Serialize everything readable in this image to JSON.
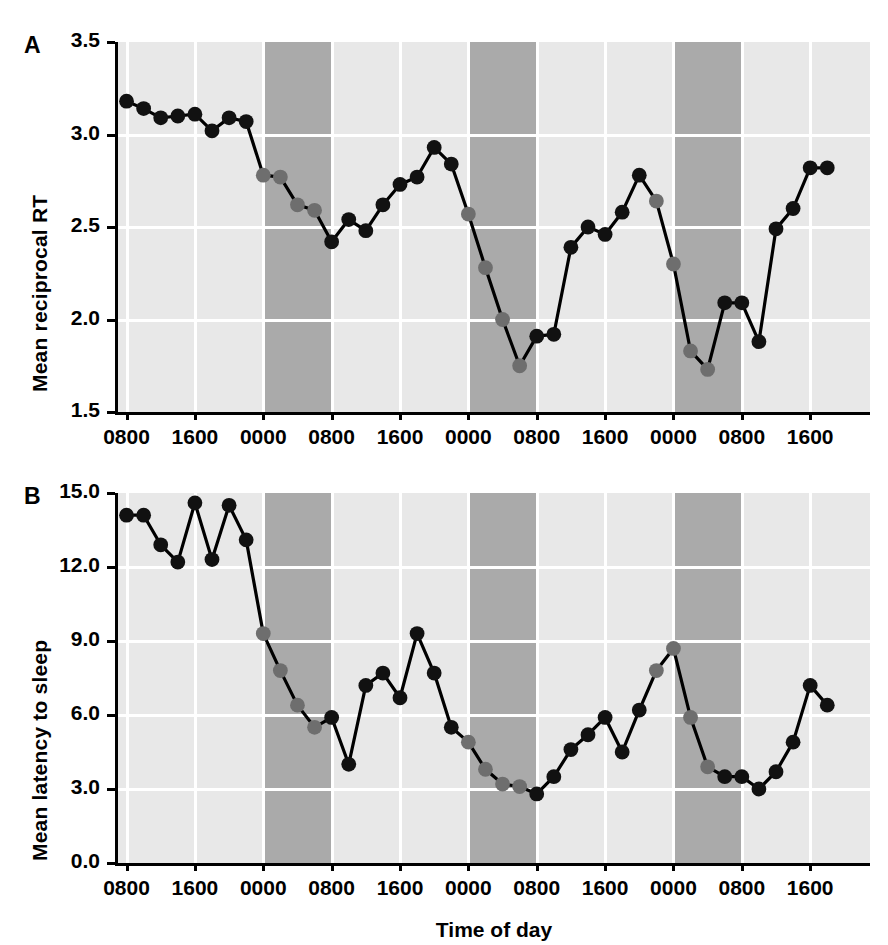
{
  "figure": {
    "xaxis_title": "Time of day",
    "tick_labels_x": [
      "0800",
      "1600",
      "0000",
      "0800",
      "1600",
      "0000",
      "0800",
      "1600",
      "0000",
      "0800",
      "1600"
    ],
    "colors": {
      "daytime_band": "#e8e8e8",
      "night_band": "#aaaaaa",
      "gridline": "#ffffff",
      "line": "#000000",
      "marker_wake": "#111111",
      "marker_sleep": "#6e6e6e"
    }
  },
  "chart_data": [
    {
      "type": "line",
      "panel": "A",
      "panel_letter": "A",
      "title": "",
      "xlabel": "Time of day",
      "ylabel": "Mean reciprocal RT",
      "ylim": [
        1.5,
        3.5
      ],
      "ytick_labels": [
        "3.5",
        "3.0",
        "2.5",
        "2.0",
        "1.5"
      ],
      "yticks": [
        3.5,
        3.0,
        2.5,
        2.0,
        1.5
      ],
      "xlim_hours": [
        7,
        95
      ],
      "xtick_hours": [
        8,
        16,
        24,
        32,
        40,
        48,
        56,
        64,
        72,
        80,
        88
      ],
      "xtick_labels": [
        "0800",
        "1600",
        "0000",
        "0800",
        "1600",
        "0000",
        "0800",
        "1600",
        "0000",
        "0800",
        "1600"
      ],
      "grid": true,
      "legend": "none",
      "night_bands_hours": [
        [
          24,
          32
        ],
        [
          48,
          56
        ],
        [
          72,
          80
        ]
      ],
      "x": [
        8,
        10,
        12,
        14,
        16,
        18,
        20,
        22,
        24,
        26,
        28,
        30,
        32,
        34,
        36,
        38,
        40,
        42,
        44,
        46,
        48,
        50,
        52,
        54,
        56,
        58,
        60,
        62,
        64,
        66,
        68,
        70,
        72,
        74,
        76,
        78,
        80,
        82,
        84,
        86,
        88,
        90
      ],
      "values": [
        3.18,
        3.14,
        3.09,
        3.1,
        3.11,
        3.02,
        3.09,
        3.07,
        2.78,
        2.77,
        2.62,
        2.59,
        2.42,
        2.54,
        2.48,
        2.62,
        2.73,
        2.77,
        2.93,
        2.84,
        2.57,
        2.28,
        2.0,
        1.75,
        1.91,
        1.92,
        2.39,
        2.5,
        2.46,
        2.58,
        2.78,
        2.64,
        2.3,
        1.83,
        1.73,
        2.09,
        2.09,
        1.88,
        2.49,
        2.6,
        2.82,
        2.82
      ],
      "marker_state": [
        "wake",
        "wake",
        "wake",
        "wake",
        "wake",
        "wake",
        "wake",
        "wake",
        "sleep",
        "sleep",
        "sleep",
        "sleep",
        "wake",
        "wake",
        "wake",
        "wake",
        "wake",
        "wake",
        "wake",
        "wake",
        "sleep",
        "sleep",
        "sleep",
        "sleep",
        "wake",
        "wake",
        "wake",
        "wake",
        "wake",
        "wake",
        "wake",
        "sleep",
        "sleep",
        "sleep",
        "sleep",
        "wake",
        "wake",
        "wake",
        "wake",
        "wake",
        "wake",
        "wake"
      ]
    },
    {
      "type": "line",
      "panel": "B",
      "panel_letter": "B",
      "title": "",
      "xlabel": "Time of day",
      "ylabel": "Mean latency to sleep",
      "ylim": [
        0.0,
        15.0
      ],
      "ytick_labels": [
        "15.0",
        "12.0",
        "9.0",
        "6.0",
        "3.0",
        "0.0"
      ],
      "yticks": [
        15.0,
        12.0,
        9.0,
        6.0,
        3.0,
        0.0
      ],
      "xlim_hours": [
        7,
        95
      ],
      "xtick_hours": [
        8,
        16,
        24,
        32,
        40,
        48,
        56,
        64,
        72,
        80,
        88
      ],
      "xtick_labels": [
        "0800",
        "1600",
        "0000",
        "0800",
        "1600",
        "0000",
        "0800",
        "1600",
        "0000",
        "0800",
        "1600"
      ],
      "grid": true,
      "legend": "none",
      "night_bands_hours": [
        [
          24,
          32
        ],
        [
          48,
          56
        ],
        [
          72,
          80
        ]
      ],
      "x": [
        8,
        10,
        12,
        14,
        16,
        18,
        20,
        22,
        24,
        26,
        28,
        30,
        32,
        34,
        36,
        38,
        40,
        42,
        44,
        46,
        48,
        50,
        52,
        54,
        56,
        58,
        60,
        62,
        64,
        66,
        68,
        70,
        72,
        74,
        76,
        78,
        80,
        82,
        84,
        86,
        88,
        90
      ],
      "values": [
        14.1,
        14.1,
        12.9,
        12.2,
        14.6,
        12.3,
        14.5,
        13.1,
        9.3,
        7.8,
        6.4,
        5.5,
        5.9,
        4.0,
        7.2,
        7.7,
        6.7,
        9.3,
        7.7,
        5.5,
        4.9,
        3.8,
        3.2,
        3.1,
        2.8,
        3.5,
        4.6,
        5.2,
        5.9,
        4.5,
        6.2,
        7.8,
        8.7,
        5.9,
        3.9,
        3.5,
        3.5,
        3.0,
        3.7,
        4.9,
        7.2,
        6.4
      ],
      "values_last": 8.5,
      "marker_state": [
        "wake",
        "wake",
        "wake",
        "wake",
        "wake",
        "wake",
        "wake",
        "wake",
        "sleep",
        "sleep",
        "sleep",
        "sleep",
        "wake",
        "wake",
        "wake",
        "wake",
        "wake",
        "wake",
        "wake",
        "wake",
        "sleep",
        "sleep",
        "sleep",
        "sleep",
        "wake",
        "wake",
        "wake",
        "wake",
        "wake",
        "wake",
        "wake",
        "sleep",
        "sleep",
        "sleep",
        "sleep",
        "wake",
        "wake",
        "wake",
        "wake",
        "wake",
        "wake",
        "wake"
      ]
    }
  ]
}
